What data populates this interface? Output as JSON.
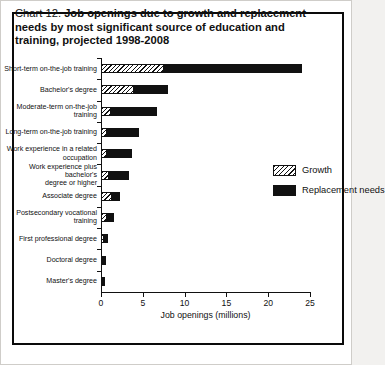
{
  "figure": {
    "title_prefix": "Chart 12.",
    "title_bold": "Job openings due to growth and replacement needs by most significant source of education and training, projected 1998-2008"
  },
  "legend": {
    "position": "inside-right",
    "items": [
      {
        "key": "growth",
        "label": "Growth",
        "pattern": "diagonal-hatch",
        "color": "#111111"
      },
      {
        "key": "replacement",
        "label": "Replacement needs",
        "pattern": "solid",
        "color": "#111111"
      }
    ]
  },
  "chart_data": {
    "type": "bar",
    "orientation": "horizontal",
    "stacked": true,
    "title": "Chart 12. Job openings due to growth and replacement needs by most significant source of education and training, projected 1998-2008",
    "xlabel": "Job openings (millions)",
    "ylabel": "",
    "xlim": [
      0,
      25
    ],
    "xticks": [
      0,
      5,
      10,
      15,
      20,
      25
    ],
    "xticklabels": [
      "0",
      "5",
      "10",
      "15",
      "20",
      "25"
    ],
    "grid": false,
    "categories": [
      "Short-term on-the-job training",
      "Bachelor's degree",
      "Moderate-term on-the-job\ntraining",
      "Long-term on-the-job training",
      "Work experience in a related\noccupation",
      "Work experience plus bachelor's\ndegree or higher",
      "Associate degree",
      "Postsecondary vocational\ntraining",
      "First professional degree",
      "Doctoral degree",
      "Master's degree"
    ],
    "series": [
      {
        "name": "Growth",
        "values": [
          7.5,
          3.9,
          1.2,
          0.7,
          0.7,
          1.0,
          1.3,
          0.7,
          0.3,
          0.2,
          0.2
        ]
      },
      {
        "name": "Replacement needs",
        "values": [
          16.5,
          4.1,
          5.5,
          3.9,
          3.0,
          2.4,
          1.0,
          0.9,
          0.5,
          0.4,
          0.3
        ]
      }
    ],
    "totals": [
      24.0,
      8.0,
      6.7,
      4.6,
      3.7,
      3.4,
      2.3,
      1.6,
      0.8,
      0.6,
      0.5
    ]
  }
}
